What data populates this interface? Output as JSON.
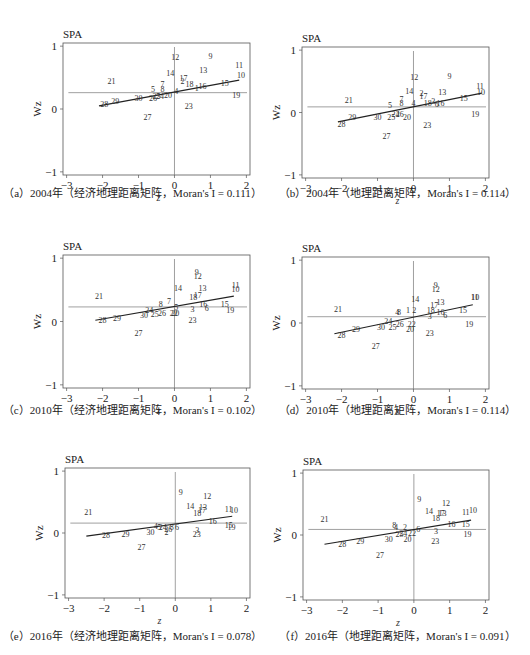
{
  "figure": {
    "panel_title": "SPA",
    "x_label": "z",
    "y_label": "Wz",
    "x_ticks": [
      "-3",
      "-2",
      "-1",
      "0",
      "1",
      "2"
    ],
    "y_ticks": [
      "1",
      "0",
      "-1"
    ]
  },
  "chart_data": [
    {
      "id": "a",
      "type": "scatter",
      "title": "SPA",
      "caption": "（a）2004年（经济地理距离矩阵，Moran's I = 0.111）",
      "xlabel": "z",
      "ylabel": "Wz",
      "xlim": [
        -3,
        2
      ],
      "ylim": [
        -1,
        1
      ],
      "mean_wz": 0.26,
      "fit_line": {
        "x1": -2.1,
        "y1": 0.05,
        "x2": 1.8,
        "y2": 0.46
      },
      "points": [
        {
          "label": "21",
          "x": -1.75,
          "y": 0.45
        },
        {
          "label": "28",
          "x": -1.95,
          "y": 0.08
        },
        {
          "label": "29",
          "x": -1.65,
          "y": 0.13
        },
        {
          "label": "30",
          "x": -1.0,
          "y": 0.18
        },
        {
          "label": "27",
          "x": -0.75,
          "y": -0.13
        },
        {
          "label": "5",
          "x": -0.6,
          "y": 0.32
        },
        {
          "label": "7",
          "x": -0.33,
          "y": 0.4
        },
        {
          "label": "8",
          "x": -0.33,
          "y": 0.32
        },
        {
          "label": "26",
          "x": -0.6,
          "y": 0.18
        },
        {
          "label": "25",
          "x": -0.5,
          "y": 0.2
        },
        {
          "label": "24",
          "x": -0.4,
          "y": 0.21
        },
        {
          "label": "20",
          "x": -0.18,
          "y": 0.22
        },
        {
          "label": "14",
          "x": -0.12,
          "y": 0.57
        },
        {
          "label": "12",
          "x": 0.02,
          "y": 0.83
        },
        {
          "label": "4",
          "x": 0.05,
          "y": 0.28
        },
        {
          "label": "17",
          "x": 0.25,
          "y": 0.49
        },
        {
          "label": "2",
          "x": 0.22,
          "y": 0.45
        },
        {
          "label": "18",
          "x": 0.42,
          "y": 0.4
        },
        {
          "label": "9",
          "x": 1.0,
          "y": 0.84
        },
        {
          "label": "13",
          "x": 0.8,
          "y": 0.62
        },
        {
          "label": "1",
          "x": 0.62,
          "y": 0.33
        },
        {
          "label": "16",
          "x": 0.78,
          "y": 0.36
        },
        {
          "label": "15",
          "x": 1.4,
          "y": 0.42
        },
        {
          "label": "11",
          "x": 1.8,
          "y": 0.7
        },
        {
          "label": "10",
          "x": 1.85,
          "y": 0.54
        },
        {
          "label": "19",
          "x": 1.72,
          "y": 0.22
        },
        {
          "label": "23",
          "x": 0.4,
          "y": 0.05
        }
      ]
    },
    {
      "id": "b",
      "type": "scatter",
      "title": "SPA",
      "caption": "（b）2004年（地理距离矩阵，Moran's I = 0.114）",
      "xlabel": "z",
      "ylabel": "Wz",
      "xlim": [
        -3,
        2
      ],
      "ylim": [
        -1,
        1
      ],
      "mean_wz": 0.09,
      "fit_line": {
        "x1": -2.1,
        "y1": -0.15,
        "x2": 1.9,
        "y2": 0.31
      },
      "points": [
        {
          "label": "21",
          "x": -1.8,
          "y": 0.2
        },
        {
          "label": "28",
          "x": -2.0,
          "y": -0.18
        },
        {
          "label": "29",
          "x": -1.7,
          "y": -0.08
        },
        {
          "label": "30",
          "x": -1.0,
          "y": -0.08
        },
        {
          "label": "27",
          "x": -0.75,
          "y": -0.38
        },
        {
          "label": "5",
          "x": -0.65,
          "y": 0.12
        },
        {
          "label": "7",
          "x": -0.33,
          "y": 0.22
        },
        {
          "label": "8",
          "x": -0.33,
          "y": 0.15
        },
        {
          "label": "25",
          "x": -0.62,
          "y": -0.08
        },
        {
          "label": "24",
          "x": -0.5,
          "y": -0.02
        },
        {
          "label": "26",
          "x": -0.38,
          "y": -0.02
        },
        {
          "label": "20",
          "x": -0.18,
          "y": -0.08
        },
        {
          "label": "14",
          "x": -0.12,
          "y": 0.35
        },
        {
          "label": "12",
          "x": 0.02,
          "y": 0.57
        },
        {
          "label": "4",
          "x": 0.0,
          "y": 0.15
        },
        {
          "label": "2",
          "x": 0.22,
          "y": 0.32
        },
        {
          "label": "17",
          "x": 0.28,
          "y": 0.26
        },
        {
          "label": "18",
          "x": 0.4,
          "y": 0.15
        },
        {
          "label": "3",
          "x": 0.55,
          "y": 0.19
        },
        {
          "label": "6",
          "x": 0.65,
          "y": 0.13
        },
        {
          "label": "16",
          "x": 0.75,
          "y": 0.16
        },
        {
          "label": "13",
          "x": 0.8,
          "y": 0.33
        },
        {
          "label": "9",
          "x": 1.0,
          "y": 0.58
        },
        {
          "label": "15",
          "x": 1.4,
          "y": 0.24
        },
        {
          "label": "11",
          "x": 1.85,
          "y": 0.42
        },
        {
          "label": "10",
          "x": 1.88,
          "y": 0.33
        },
        {
          "label": "19",
          "x": 1.72,
          "y": -0.02
        },
        {
          "label": "23",
          "x": 0.38,
          "y": -0.2
        }
      ]
    },
    {
      "id": "c",
      "type": "scatter",
      "title": "SPA",
      "caption": "（c）2010年（经济地理距离矩阵，Moran's I = 0.102）",
      "xlabel": "z",
      "ylabel": "Wz",
      "xlim": [
        -3,
        2
      ],
      "ylim": [
        -1,
        1
      ],
      "mean_wz": 0.23,
      "fit_line": {
        "x1": -2.2,
        "y1": 0.02,
        "x2": 1.65,
        "y2": 0.4
      },
      "points": [
        {
          "label": "21",
          "x": -2.1,
          "y": 0.4
        },
        {
          "label": "28",
          "x": -2.0,
          "y": 0.02
        },
        {
          "label": "29",
          "x": -1.6,
          "y": 0.06
        },
        {
          "label": "30",
          "x": -0.85,
          "y": 0.1
        },
        {
          "label": "27",
          "x": -1.0,
          "y": -0.18
        },
        {
          "label": "24",
          "x": -0.7,
          "y": 0.18
        },
        {
          "label": "25",
          "x": -0.55,
          "y": 0.12
        },
        {
          "label": "26",
          "x": -0.35,
          "y": 0.14
        },
        {
          "label": "8",
          "x": -0.38,
          "y": 0.27
        },
        {
          "label": "7",
          "x": -0.15,
          "y": 0.32
        },
        {
          "label": "5",
          "x": 0.05,
          "y": 0.23
        },
        {
          "label": "22",
          "x": -0.02,
          "y": 0.14
        },
        {
          "label": "20",
          "x": 0.02,
          "y": 0.14
        },
        {
          "label": "14",
          "x": 0.1,
          "y": 0.53
        },
        {
          "label": "3",
          "x": 0.5,
          "y": 0.2
        },
        {
          "label": "23",
          "x": 0.5,
          "y": 0.03
        },
        {
          "label": "9",
          "x": 0.62,
          "y": 0.78
        },
        {
          "label": "12",
          "x": 0.65,
          "y": 0.72
        },
        {
          "label": "13",
          "x": 0.78,
          "y": 0.53
        },
        {
          "label": "17",
          "x": 0.65,
          "y": 0.42
        },
        {
          "label": "18",
          "x": 0.52,
          "y": 0.38
        },
        {
          "label": "16",
          "x": 0.8,
          "y": 0.28
        },
        {
          "label": "6",
          "x": 0.9,
          "y": 0.22
        },
        {
          "label": "15",
          "x": 1.4,
          "y": 0.28
        },
        {
          "label": "19",
          "x": 1.55,
          "y": 0.18
        },
        {
          "label": "11",
          "x": 1.7,
          "y": 0.58
        },
        {
          "label": "10",
          "x": 1.7,
          "y": 0.51
        }
      ]
    },
    {
      "id": "d",
      "type": "scatter",
      "title": "SPA",
      "caption": "（d）2010年（地理距离矩阵，Moran's I = 0.114）",
      "xlabel": "z",
      "ylabel": "Wz",
      "xlim": [
        -3,
        2
      ],
      "ylim": [
        -1,
        1
      ],
      "mean_wz": 0.1,
      "fit_line": {
        "x1": -2.2,
        "y1": -0.17,
        "x2": 1.65,
        "y2": 0.29
      },
      "points": [
        {
          "label": "21",
          "x": -2.1,
          "y": 0.22
        },
        {
          "label": "28",
          "x": -2.0,
          "y": -0.19
        },
        {
          "label": "29",
          "x": -1.6,
          "y": -0.1
        },
        {
          "label": "30",
          "x": -0.9,
          "y": -0.07
        },
        {
          "label": "27",
          "x": -1.05,
          "y": -0.36
        },
        {
          "label": "24",
          "x": -0.7,
          "y": 0.03
        },
        {
          "label": "25",
          "x": -0.58,
          "y": -0.06
        },
        {
          "label": "26",
          "x": -0.38,
          "y": -0.02
        },
        {
          "label": "4",
          "x": -0.45,
          "y": 0.17
        },
        {
          "label": "8",
          "x": -0.4,
          "y": 0.17
        },
        {
          "label": "1",
          "x": -0.15,
          "y": 0.2
        },
        {
          "label": "2",
          "x": 0.02,
          "y": 0.2
        },
        {
          "label": "22",
          "x": -0.05,
          "y": -0.02
        },
        {
          "label": "20",
          "x": -0.1,
          "y": -0.09
        },
        {
          "label": "14",
          "x": 0.05,
          "y": 0.38
        },
        {
          "label": "3",
          "x": 0.45,
          "y": 0.11
        },
        {
          "label": "23",
          "x": 0.45,
          "y": -0.16
        },
        {
          "label": "9",
          "x": 0.62,
          "y": 0.6
        },
        {
          "label": "12",
          "x": 0.62,
          "y": 0.54
        },
        {
          "label": "13",
          "x": 0.75,
          "y": 0.33
        },
        {
          "label": "17",
          "x": 0.58,
          "y": 0.28
        },
        {
          "label": "18",
          "x": 0.48,
          "y": 0.2
        },
        {
          "label": "16",
          "x": 0.75,
          "y": 0.17
        },
        {
          "label": "6",
          "x": 0.88,
          "y": 0.12
        },
        {
          "label": "15",
          "x": 1.38,
          "y": 0.21
        },
        {
          "label": "19",
          "x": 1.55,
          "y": -0.02
        },
        {
          "label": "11",
          "x": 1.7,
          "y": 0.41
        },
        {
          "label": "10",
          "x": 1.72,
          "y": 0.41
        }
      ]
    },
    {
      "id": "e",
      "type": "scatter",
      "title": "SPA",
      "caption": "（e）2016年（经济地理距离矩阵，Moran's I = 0.078）",
      "xlabel": "z",
      "ylabel": "Wz",
      "xlim": [
        -3,
        2
      ],
      "ylim": [
        -1,
        1
      ],
      "mean_wz": 0.16,
      "fit_line": {
        "x1": -2.5,
        "y1": -0.05,
        "x2": 1.6,
        "y2": 0.27
      },
      "points": [
        {
          "label": "21",
          "x": -2.45,
          "y": 0.34
        },
        {
          "label": "28",
          "x": -1.95,
          "y": -0.04
        },
        {
          "label": "29",
          "x": -1.4,
          "y": -0.02
        },
        {
          "label": "30",
          "x": -0.7,
          "y": 0.01
        },
        {
          "label": "27",
          "x": -0.95,
          "y": -0.22
        },
        {
          "label": "4",
          "x": -0.55,
          "y": 0.12
        },
        {
          "label": "5",
          "x": -0.45,
          "y": 0.1
        },
        {
          "label": "24",
          "x": -0.35,
          "y": 0.1
        },
        {
          "label": "26",
          "x": -0.2,
          "y": 0.07
        },
        {
          "label": "2",
          "x": -0.25,
          "y": 0.01
        },
        {
          "label": "8",
          "x": -0.1,
          "y": 0.1
        },
        {
          "label": "6",
          "x": 0.05,
          "y": 0.1
        },
        {
          "label": "9",
          "x": 0.15,
          "y": 0.66
        },
        {
          "label": "14",
          "x": 0.42,
          "y": 0.44
        },
        {
          "label": "12",
          "x": 0.9,
          "y": 0.6
        },
        {
          "label": "13",
          "x": 0.78,
          "y": 0.42
        },
        {
          "label": "17",
          "x": 0.75,
          "y": 0.37
        },
        {
          "label": "18",
          "x": 0.62,
          "y": 0.32
        },
        {
          "label": "3",
          "x": 0.62,
          "y": 0.05
        },
        {
          "label": "23",
          "x": 0.6,
          "y": -0.01
        },
        {
          "label": "16",
          "x": 1.05,
          "y": 0.2
        },
        {
          "label": "11",
          "x": 1.5,
          "y": 0.39
        },
        {
          "label": "10",
          "x": 1.65,
          "y": 0.37
        },
        {
          "label": "15",
          "x": 1.5,
          "y": 0.13
        },
        {
          "label": "19",
          "x": 1.58,
          "y": 0.1
        }
      ]
    },
    {
      "id": "f",
      "type": "scatter",
      "title": "SPA",
      "caption": "（f）2016年（地理距离矩阵，Moran's I = 0.091）",
      "xlabel": "z",
      "ylabel": "Wz",
      "xlim": [
        -3,
        2
      ],
      "ylim": [
        -1,
        1
      ],
      "mean_wz": 0.09,
      "fit_line": {
        "x1": -2.5,
        "y1": -0.15,
        "x2": 1.6,
        "y2": 0.24
      },
      "points": [
        {
          "label": "21",
          "x": -2.5,
          "y": 0.26
        },
        {
          "label": "28",
          "x": -2.0,
          "y": -0.14
        },
        {
          "label": "29",
          "x": -1.5,
          "y": -0.09
        },
        {
          "label": "30",
          "x": -0.7,
          "y": -0.07
        },
        {
          "label": "27",
          "x": -0.95,
          "y": -0.32
        },
        {
          "label": "8",
          "x": -0.55,
          "y": 0.16
        },
        {
          "label": "4",
          "x": -0.5,
          "y": 0.13
        },
        {
          "label": "2",
          "x": -0.25,
          "y": 0.13
        },
        {
          "label": "25",
          "x": -0.4,
          "y": 0.01
        },
        {
          "label": "24",
          "x": -0.3,
          "y": 0.04
        },
        {
          "label": "20",
          "x": -0.18,
          "y": -0.07
        },
        {
          "label": "22",
          "x": -0.05,
          "y": 0.04
        },
        {
          "label": "6",
          "x": 0.12,
          "y": 0.1
        },
        {
          "label": "9",
          "x": 0.15,
          "y": 0.58
        },
        {
          "label": "14",
          "x": 0.42,
          "y": 0.39
        },
        {
          "label": "12",
          "x": 0.9,
          "y": 0.51
        },
        {
          "label": "13",
          "x": 0.8,
          "y": 0.36
        },
        {
          "label": "17",
          "x": 0.75,
          "y": 0.35
        },
        {
          "label": "18",
          "x": 0.62,
          "y": 0.27
        },
        {
          "label": "3",
          "x": 0.62,
          "y": 0.07
        },
        {
          "label": "23",
          "x": 0.6,
          "y": -0.1
        },
        {
          "label": "16",
          "x": 1.05,
          "y": 0.18
        },
        {
          "label": "15",
          "x": 1.45,
          "y": 0.17
        },
        {
          "label": "11",
          "x": 1.45,
          "y": 0.37
        },
        {
          "label": "10",
          "x": 1.65,
          "y": 0.4
        },
        {
          "label": "19",
          "x": 1.5,
          "y": 0.01
        }
      ]
    }
  ]
}
